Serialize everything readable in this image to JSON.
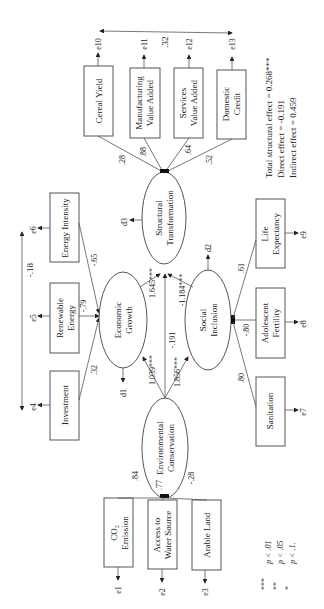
{
  "diagram": {
    "type": "structural-equation-model",
    "orientation": "rotated-90-ccw",
    "latent": {
      "structural": {
        "label1": "Structural",
        "label2": "Transformation",
        "disturbance": "d3"
      },
      "economic": {
        "label1": "Economic",
        "label2": "Growth",
        "disturbance": "d1"
      },
      "social": {
        "label1": "Social",
        "label2": "Inclusion",
        "disturbance": "d2"
      },
      "environmental": {
        "label1": "Environmental",
        "label2": "Conservation"
      }
    },
    "indicators": {
      "cereal": {
        "label1": "Cereal Yield",
        "label2": "",
        "error": "e10",
        "loading": ".28"
      },
      "manufacturing": {
        "label1": "Manufacturing",
        "label2": "Value Added",
        "error": "e11",
        "loading": ".88"
      },
      "services": {
        "label1": "Services",
        "label2": "Value Added",
        "error": "e12",
        "loading": ".64"
      },
      "domestic": {
        "label1": "Domestic",
        "label2": "Credit",
        "error": "e13",
        "loading": ".52"
      },
      "energy_int": {
        "label1": "Energy Intensity",
        "label2": "",
        "error": "e6",
        "loading": "-.65"
      },
      "renewable": {
        "label1": "Renewable",
        "label2": "Energy",
        "error": "e5",
        "loading": "-.79"
      },
      "investment": {
        "label1": "Investment",
        "label2": "",
        "error": "e4",
        "loading": ".32"
      },
      "life_exp": {
        "label1": "Life",
        "label2": "Expectancy",
        "error": "e9",
        "loading": ".61"
      },
      "adolescent": {
        "label1": "Adolescent",
        "label2": "Fertility",
        "error": "e8",
        "loading": "-.80"
      },
      "sanitation": {
        "label1": "Sanitation",
        "label2": "",
        "error": "e7",
        "loading": ".80"
      },
      "co2": {
        "label1": "CO₂",
        "label2": "Emission",
        "error": "e1",
        "loading": ".84"
      },
      "water": {
        "label1": "Access to",
        "label2": "Water Source",
        "error": "e2",
        "loading": ".77"
      },
      "arable": {
        "label1": "Arable Land",
        "label2": "",
        "error": "e3",
        "loading": "-.28"
      }
    },
    "paths": {
      "eg_to_st": "1.645***",
      "si_to_st": "-1.184***",
      "ec_to_st": "-.191",
      "ec_to_eg": "1.039***",
      "ec_to_si": "1.856***"
    },
    "covariances": {
      "e10_e13": ".32",
      "e4_e6": "-.18"
    },
    "effects": {
      "total": "Total structural effect = 0.268***",
      "direct": "Direct effect = -0.191",
      "indirect": "Indirect effect = 0.459"
    },
    "legend": [
      {
        "stars": "***",
        "text": "p < .01"
      },
      {
        "stars": "**",
        "text": "p < .05"
      },
      {
        "stars": "*",
        "text": "p < .1."
      }
    ]
  }
}
